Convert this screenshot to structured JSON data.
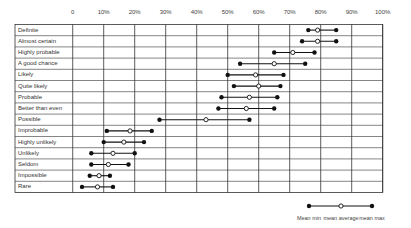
{
  "chart_data": {
    "type": "range-dot",
    "title": "",
    "xlabel": "",
    "ylabel": "",
    "xlim": [
      0,
      100
    ],
    "x_ticks": [
      "0",
      "10%",
      "20%",
      "30%",
      "40%",
      "50%",
      "60%",
      "70%",
      "80%",
      "90%",
      "100%"
    ],
    "grid": true,
    "categories": [
      "Definite",
      "Almost certain",
      "Highly probable",
      "A good chance",
      "Likely",
      "Quite likely",
      "Probable",
      "Better than even",
      "Possible",
      "Improbable",
      "Highly unlikely",
      "Unlikely",
      "Seldom",
      "Impossible",
      "Rare"
    ],
    "series": [
      {
        "name": "Mean min",
        "values": [
          76,
          74,
          65,
          54,
          50,
          52,
          48,
          47,
          28,
          11,
          10,
          6,
          6,
          5.5,
          3
        ]
      },
      {
        "name": "mean average",
        "values": [
          79,
          79,
          71,
          65,
          59,
          60,
          57,
          56,
          43,
          18.5,
          16.5,
          13,
          11.5,
          8.5,
          8
        ]
      },
      {
        "name": "mean max",
        "values": [
          85,
          85,
          78,
          75,
          68,
          67,
          66,
          65,
          57,
          25.5,
          23,
          20,
          18,
          12,
          13
        ]
      }
    ],
    "legend": {
      "position": "bottom-right",
      "entries": [
        "Mean min",
        "mean average",
        "mean max"
      ]
    }
  },
  "colors": {
    "line": "#111111",
    "grid": "#333333",
    "dot_fill": "#111111",
    "avg_fill": "#ffffff"
  }
}
